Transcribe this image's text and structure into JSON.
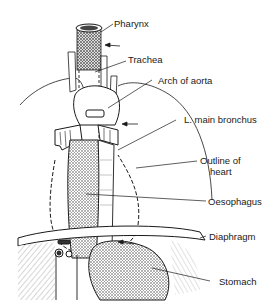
{
  "diagram": {
    "title": "",
    "labels": [
      {
        "id": "pharynx",
        "text": "Pharynx"
      },
      {
        "id": "trachea",
        "text": "Trachea"
      },
      {
        "id": "arch_of_aorta",
        "text": "Arch of aorta"
      },
      {
        "id": "l_main_bronchus",
        "text": "L. main bronchus"
      },
      {
        "id": "outline_of_heart_1",
        "text": "Outline of"
      },
      {
        "id": "outline_of_heart_2",
        "text": "heart"
      },
      {
        "id": "oesophagus",
        "text": "Oesophagus"
      },
      {
        "id": "diaphragm",
        "text": "Diaphragm"
      },
      {
        "id": "stomach",
        "text": "Stomach"
      }
    ],
    "arrows": [
      {
        "id": "arrow-upper",
        "points_to": "oesophagus near trachea"
      },
      {
        "id": "arrow-middle",
        "points_to": "oesophagus near L. main bronchus"
      },
      {
        "id": "arrow-lower",
        "points_to": "oesophagus at diaphragm"
      }
    ],
    "colors": {
      "ink": "#1a1a1a",
      "background": "#ffffff",
      "shading": "#8a8a8a"
    }
  }
}
